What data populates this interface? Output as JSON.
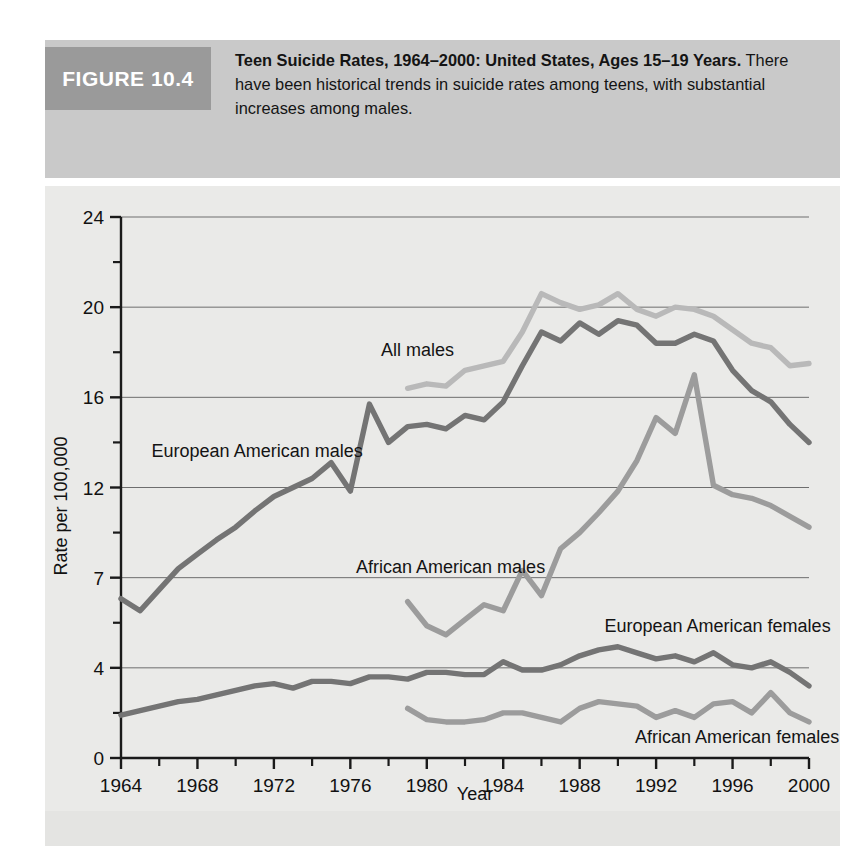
{
  "figure": {
    "tag": "FIGURE 10.4",
    "title_bold": "Teen Suicide Rates, 1964–2000: United States, Ages 15–19 Years.",
    "description": " There have been historical trends in suicide rates among teens, with substantial increases among males."
  },
  "colors": {
    "tag_background": "#9a9a9a",
    "caption_background": "#c9c9c9",
    "panel_background": "#eaeae8",
    "axis": "#1a1a1a",
    "gridline": "#6e6e6e",
    "all_males": "#b9b9b9",
    "european_american_males": "#747474",
    "african_american_males": "#9c9c9c",
    "european_american_females": "#747474",
    "african_american_females": "#9c9c9c"
  },
  "chart_data": {
    "type": "line",
    "title": "Teen Suicide Rates, 1964–2000: United States, Ages 15–19 Years",
    "xlabel": "Year",
    "ylabel": "Rate per 100,000",
    "xlim": [
      1964,
      2000
    ],
    "ylim": [
      0,
      24
    ],
    "grid": true,
    "legend": "inline-labels",
    "x_tick_labels": [
      "1964",
      "1968",
      "1972",
      "1976",
      "1980",
      "1984",
      "1988",
      "1992",
      "1996",
      "2000"
    ],
    "x_major_ticks": [
      1964,
      1968,
      1972,
      1976,
      1980,
      1984,
      1988,
      1992,
      1996,
      2000
    ],
    "x_minor_ticks": [
      1966,
      1970,
      1974,
      1978,
      1982,
      1986,
      1990,
      1994,
      1998
    ],
    "y_tick_labels": [
      "0",
      "4",
      "7",
      "12",
      "16",
      "20",
      "24"
    ],
    "y_tick_values": [
      0,
      4,
      7,
      12,
      16,
      20,
      24
    ],
    "y_tick_positions": [
      0,
      1,
      2,
      3,
      4,
      5,
      6
    ],
    "y_minor_positions": [
      0.5,
      1.5,
      2.5,
      3.5,
      4.5,
      5.5
    ],
    "series": [
      {
        "name": "All males",
        "label": "All males",
        "color": "#b9b9b9",
        "label_x": 1977.6,
        "label_y_value": 18.1,
        "x": [
          1979,
          1980,
          1981,
          1982,
          1983,
          1984,
          1985,
          1986,
          1987,
          1988,
          1989,
          1990,
          1991,
          1992,
          1993,
          1994,
          1995,
          1996,
          1997,
          1998,
          1999,
          2000
        ],
        "values": [
          16.4,
          16.6,
          16.5,
          17.2,
          17.4,
          17.6,
          18.9,
          20.6,
          20.2,
          19.9,
          20.1,
          20.6,
          19.9,
          19.6,
          20.0,
          19.9,
          19.6,
          19.0,
          18.4,
          18.2,
          17.4,
          17.5
        ]
      },
      {
        "name": "European American males",
        "label": "European American males",
        "color": "#747474",
        "label_x": 1965.6,
        "label_y_value": 13.6,
        "x": [
          1964,
          1965,
          1966,
          1967,
          1968,
          1969,
          1970,
          1971,
          1972,
          1973,
          1974,
          1975,
          1976,
          1977,
          1978,
          1979,
          1980,
          1981,
          1982,
          1983,
          1984,
          1985,
          1986,
          1987,
          1988,
          1989,
          1990,
          1991,
          1992,
          1993,
          1994,
          1995,
          1996,
          1997,
          1998,
          1999,
          2000
        ],
        "values": [
          6.3,
          5.9,
          6.6,
          7.5,
          8.3,
          9.1,
          9.8,
          10.7,
          11.5,
          12.0,
          12.4,
          13.1,
          11.8,
          15.7,
          14.0,
          14.7,
          14.8,
          14.6,
          15.2,
          15.0,
          15.8,
          17.4,
          18.9,
          18.5,
          19.3,
          18.8,
          19.4,
          19.2,
          18.4,
          18.4,
          18.8,
          18.5,
          17.2,
          16.3,
          15.8,
          14.8,
          14.0
        ]
      },
      {
        "name": "African American males",
        "label": "African American males",
        "color": "#9c9c9c",
        "label_x": 1976.3,
        "label_y_value": 7.6,
        "x": [
          1979,
          1980,
          1981,
          1982,
          1983,
          1984,
          1985,
          1986,
          1987,
          1988,
          1989,
          1990,
          1991,
          1992,
          1993,
          1994,
          1995,
          1996,
          1997,
          1998,
          1999,
          2000
        ],
        "values": [
          6.2,
          5.4,
          5.1,
          5.6,
          6.1,
          5.9,
          7.4,
          6.4,
          8.6,
          9.5,
          10.6,
          11.8,
          13.2,
          15.1,
          14.4,
          17.0,
          12.1,
          11.6,
          11.4,
          11.0,
          10.4,
          9.8
        ]
      },
      {
        "name": "European American females",
        "label": "European American females",
        "color": "#747474",
        "label_x": 1989.3,
        "label_y_value": 5.4,
        "x": [
          1964,
          1965,
          1966,
          1967,
          1968,
          1969,
          1970,
          1971,
          1972,
          1973,
          1974,
          1975,
          1976,
          1977,
          1978,
          1979,
          1980,
          1981,
          1982,
          1983,
          1984,
          1985,
          1986,
          1987,
          1988,
          1989,
          1990,
          1991,
          1992,
          1993,
          1994,
          1995,
          1996,
          1997,
          1998,
          1999,
          2000
        ],
        "values": [
          1.9,
          2.1,
          2.3,
          2.5,
          2.6,
          2.8,
          3.0,
          3.2,
          3.3,
          3.1,
          3.4,
          3.4,
          3.3,
          3.6,
          3.6,
          3.5,
          3.8,
          3.8,
          3.7,
          3.7,
          4.2,
          3.9,
          3.9,
          4.1,
          4.4,
          4.6,
          4.7,
          4.5,
          4.3,
          4.4,
          4.2,
          4.5,
          4.1,
          4.0,
          4.2,
          3.8,
          3.2
        ]
      },
      {
        "name": "African American females",
        "label": "African American females",
        "color": "#9c9c9c",
        "label_x": 1990.9,
        "label_y_value": 0.95,
        "x": [
          1979,
          1980,
          1981,
          1982,
          1983,
          1984,
          1985,
          1986,
          1987,
          1988,
          1989,
          1990,
          1991,
          1992,
          1993,
          1994,
          1995,
          1996,
          1997,
          1998,
          1999,
          2000
        ],
        "values": [
          2.2,
          1.7,
          1.6,
          1.6,
          1.7,
          2.0,
          2.0,
          1.8,
          1.6,
          2.2,
          2.5,
          2.4,
          2.3,
          1.8,
          2.1,
          1.8,
          2.4,
          2.5,
          2.0,
          2.9,
          2.0,
          1.6
        ]
      }
    ]
  }
}
